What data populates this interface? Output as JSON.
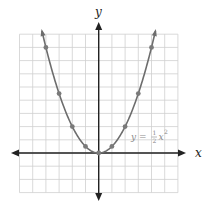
{
  "chart_data": {
    "type": "line",
    "title": "",
    "xlabel": "x",
    "ylabel": "y",
    "xlim": [
      -6,
      6
    ],
    "ylim": [
      -3,
      9
    ],
    "grid": true,
    "equation_label": "y = ½x²",
    "equation_parts": {
      "lhs": "y =",
      "num": "1",
      "den": "2",
      "var": "x",
      "exp": "2"
    },
    "series": [
      {
        "name": "y = 1/2 x^2",
        "color": "#6d6d6d",
        "points": [
          {
            "x": -4,
            "y": 8
          },
          {
            "x": -3,
            "y": 4.5
          },
          {
            "x": -2,
            "y": 2
          },
          {
            "x": -1,
            "y": 0.5
          },
          {
            "x": 0,
            "y": 0
          },
          {
            "x": 1,
            "y": 0.5
          },
          {
            "x": 2,
            "y": 2
          },
          {
            "x": 3,
            "y": 4.5
          },
          {
            "x": 4,
            "y": 8
          }
        ]
      }
    ],
    "colors": {
      "grid": "#cfcfcf",
      "axis": "#222222",
      "curve": "#6d6d6d",
      "point": "#7a7a7a"
    }
  }
}
